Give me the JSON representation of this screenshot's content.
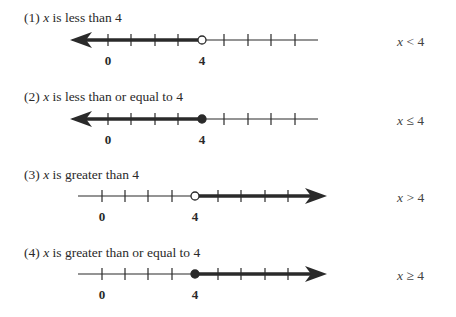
{
  "rows": [
    {
      "number": "(1)",
      "variable": "x",
      "description": "is less than 4",
      "inequality": {
        "var": "x",
        "op": "<",
        "value": "4"
      },
      "direction": "left",
      "endpoint": "open",
      "labels": {
        "zero": "0",
        "four": "4"
      }
    },
    {
      "number": "(2)",
      "variable": "x",
      "description": "is less than or equal to 4",
      "inequality": {
        "var": "x",
        "op": "≤",
        "value": "4"
      },
      "direction": "left",
      "endpoint": "closed",
      "labels": {
        "zero": "0",
        "four": "4"
      }
    },
    {
      "number": "(3)",
      "variable": "x",
      "description": "is greater than 4",
      "inequality": {
        "var": "x",
        "op": ">",
        "value": "4"
      },
      "direction": "right",
      "endpoint": "open",
      "labels": {
        "zero": "0",
        "four": "4"
      }
    },
    {
      "number": "(4)",
      "variable": "x",
      "description": "is greater than or equal to 4",
      "inequality": {
        "var": "x",
        "op": "≥",
        "value": "4"
      },
      "direction": "right",
      "endpoint": "closed",
      "labels": {
        "zero": "0",
        "four": "4"
      }
    }
  ],
  "colors": {
    "line": "#2a2a2a",
    "text": "#2a2a2a"
  }
}
